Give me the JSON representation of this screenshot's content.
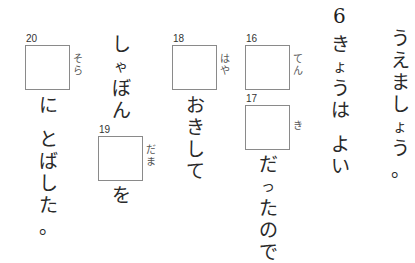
{
  "worksheet": {
    "col_right": {
      "chars": [
        "う",
        "え",
        "ま",
        "し",
        "ょ",
        "う",
        "。"
      ]
    },
    "question_number": "6",
    "col_kyou": {
      "chars": [
        "き",
        "ょ",
        "う",
        "は",
        "",
        "よ",
        "い"
      ]
    },
    "items": [
      {
        "number": "16",
        "furigana": [
          "て",
          "ん"
        ]
      },
      {
        "number": "17",
        "furigana": [
          "き"
        ]
      },
      {
        "number": "18",
        "furigana": [
          "は",
          "や"
        ]
      },
      {
        "number": "19",
        "furigana": [
          "だ",
          "ま"
        ]
      },
      {
        "number": "20",
        "furigana": [
          "そ",
          "ら"
        ]
      }
    ],
    "col_dattanode": {
      "chars": [
        "だ",
        "っ",
        "た",
        "の",
        "で"
      ]
    },
    "col_okishite": {
      "chars": [
        "お",
        "き",
        "し",
        "て"
      ]
    },
    "col_shabon": {
      "chars": [
        "し",
        "ゃ",
        "ぼ",
        "ん"
      ]
    },
    "col_wo": {
      "chars": [
        "を"
      ]
    },
    "col_nitobashita": {
      "chars": [
        "に",
        "",
        "と",
        "ば",
        "し",
        "た",
        "。"
      ]
    }
  }
}
